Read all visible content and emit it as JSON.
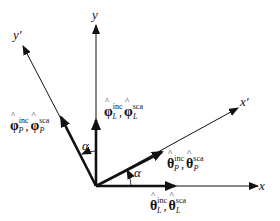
{
  "diagram": {
    "type": "coordinate-rotation",
    "axes": {
      "x": "x",
      "y": "y",
      "x_prime": "x′",
      "y_prime": "y′"
    },
    "angle_label": "α",
    "vectors": {
      "theta_L": {
        "symbol": "θ",
        "sup1": "inc",
        "sup2": "sca",
        "sub": "L"
      },
      "phi_L": {
        "symbol": "φ",
        "sup1": "inc",
        "sup2": "sca",
        "sub": "L"
      },
      "theta_P": {
        "symbol": "θ",
        "sup1": "inc",
        "sup2": "sca",
        "sub": "P"
      },
      "phi_P": {
        "symbol": "φ",
        "sup1": "inc",
        "sup2": "sca",
        "sub": "P"
      }
    },
    "separator": ",",
    "colors": {
      "stroke": "#111111",
      "background": "#ffffff"
    }
  }
}
